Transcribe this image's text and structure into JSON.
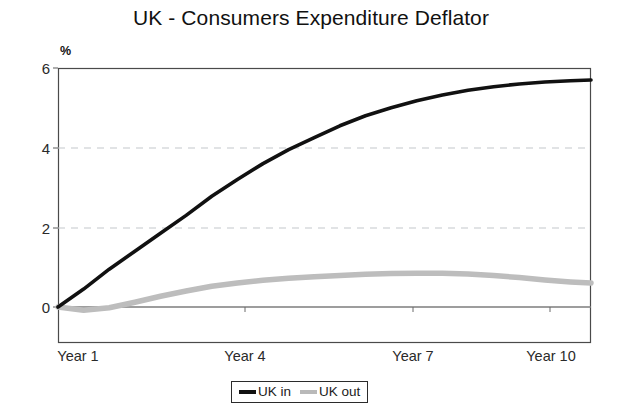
{
  "chart_data": {
    "type": "line",
    "title": "UK - Consumers Expenditure Deflator",
    "xlabel": "",
    "ylabel": "%",
    "ylim": [
      -1.3,
      6
    ],
    "yticks": [
      0,
      2,
      4,
      6
    ],
    "ytick_labels": [
      "0",
      "2",
      "4",
      "6"
    ],
    "xlim": [
      1,
      11.4
    ],
    "xticks": [
      1,
      4,
      7,
      10
    ],
    "xtick_labels": [
      "Year 1",
      "Year 4",
      "Year 7",
      "Year 10"
    ],
    "grid": "horizontal dashed gridlines at y = 2 and y = 4; solid zero line at y = 0",
    "legend_position": "bottom-center",
    "x": [
      1,
      1.5,
      2,
      2.5,
      3,
      3.5,
      4,
      4.5,
      5,
      5.5,
      6,
      6.5,
      7,
      7.5,
      8,
      8.5,
      9,
      9.5,
      10,
      10.5,
      11,
      11.4
    ],
    "series": [
      {
        "name": "UK in",
        "color": "#111111",
        "values": [
          0,
          0.45,
          0.95,
          1.4,
          1.85,
          2.3,
          2.78,
          3.2,
          3.6,
          3.95,
          4.25,
          4.55,
          4.8,
          5.0,
          5.18,
          5.32,
          5.44,
          5.53,
          5.6,
          5.65,
          5.68,
          5.7
        ]
      },
      {
        "name": "UK out",
        "color": "#bdbdbd",
        "values": [
          0,
          -0.08,
          -0.02,
          0.12,
          0.27,
          0.4,
          0.52,
          0.6,
          0.67,
          0.72,
          0.76,
          0.79,
          0.82,
          0.84,
          0.85,
          0.85,
          0.83,
          0.79,
          0.74,
          0.68,
          0.63,
          0.6
        ]
      }
    ]
  },
  "legend": {
    "items": [
      {
        "label": "UK in",
        "swatch": "line-swatch-black"
      },
      {
        "label": "UK out",
        "swatch": "line-swatch-gray"
      }
    ]
  },
  "axes": {
    "y_unit_label": "%"
  }
}
